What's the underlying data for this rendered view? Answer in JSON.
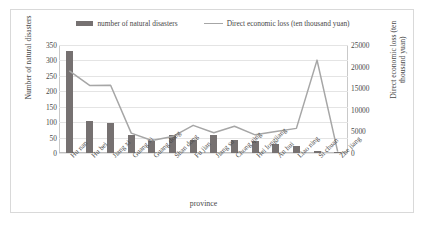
{
  "chart_data": {
    "type": "bar",
    "title": "",
    "xlabel": "province",
    "ylabel": "Number of natural disasters",
    "y2label": "Direct economic loss (ten thousand yuan)",
    "categories": [
      "Hu nan",
      "Hu bei",
      "Jiang xi",
      "Guang xi",
      "Guang dong",
      "Shan dong",
      "Fu jian",
      "Jiang su",
      "Chong qing",
      "Hei longjiang",
      "An hui",
      "Liao ning",
      "Si chuan",
      "Zhe jiang"
    ],
    "series": [
      {
        "name": "number of natural disasters",
        "type": "bar",
        "axis": "left",
        "color": "#767171",
        "values": [
          332,
          103,
          98,
          57,
          40,
          58,
          42,
          57,
          42,
          38,
          30,
          22,
          7,
          4
        ]
      },
      {
        "name": "Direct economic loss (ten thousand yuan)",
        "type": "line",
        "axis": "right",
        "color": "#a6a6a6",
        "values": [
          19000,
          15600,
          15700,
          4600,
          2900,
          3800,
          6400,
          4700,
          6200,
          4200,
          5000,
          5700,
          21500,
          300
        ]
      }
    ],
    "ylim": [
      0,
      350
    ],
    "yticks": [
      0,
      50,
      100,
      150,
      200,
      250,
      300,
      350
    ],
    "y2lim": [
      0,
      25000
    ],
    "y2ticks": [
      0,
      5000,
      10000,
      15000,
      20000,
      25000
    ],
    "grid": true,
    "legend_position": "top"
  },
  "legend": {
    "items": [
      {
        "label": "number of natural disasters"
      },
      {
        "label": "Direct economic loss (ten thousand yuan)"
      }
    ]
  }
}
